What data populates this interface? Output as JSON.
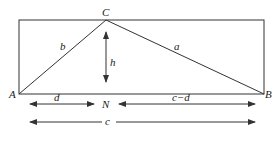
{
  "labels": {
    "C": "C",
    "A": "A",
    "B": "B",
    "N": "N",
    "b": "b",
    "a": "a",
    "h": "h",
    "d": "d",
    "c_minus_d": "c−d",
    "c": "c"
  },
  "colors": {
    "stroke": "#333333",
    "background": "#ffffff"
  }
}
